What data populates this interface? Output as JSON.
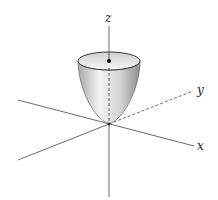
{
  "figure": {
    "axes": {
      "x_label": "x",
      "y_label": "y",
      "z_label": "z"
    },
    "colors": {
      "axis": "#333333",
      "surface_light": "#f2f2f2",
      "surface_dark": "#9a9a9a",
      "point": "#000000"
    }
  }
}
